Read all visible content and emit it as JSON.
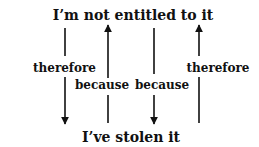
{
  "diagram": {
    "top_statement": "I’m not entitled to it",
    "bottom_statement": "I’ve stolen it",
    "arrows": [
      {
        "label": "therefore",
        "direction": "down",
        "x": 65
      },
      {
        "label": "because",
        "direction": "up",
        "x": 108
      },
      {
        "label": "because",
        "direction": "down",
        "x": 154
      },
      {
        "label": "therefore",
        "direction": "up",
        "x": 199
      }
    ],
    "colors": {
      "ink": "#111111",
      "background": "#ffffff"
    }
  }
}
